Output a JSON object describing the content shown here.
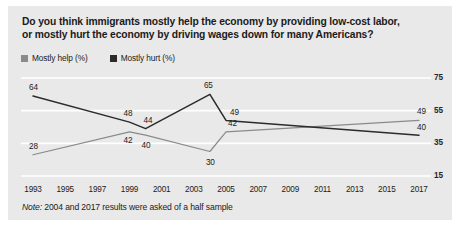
{
  "card": {
    "background": "#e9e9e9"
  },
  "title": {
    "line1": "Do you think immigrants mostly help the economy by providing low-cost labor,",
    "line2": "or mostly hurt the economy by driving wages down for many Americans?"
  },
  "note": {
    "prefix": "Note:",
    "text": " 2004 and 2017 results were asked of a half sample"
  },
  "chart_data": {
    "type": "line",
    "title": "Do you think immigrants mostly help the economy by providing low-cost labor, or mostly hurt the economy by driving wages down for many Americans?",
    "xlabel": "",
    "ylabel": "",
    "ylim": [
      15,
      75
    ],
    "yticks": [
      75,
      55,
      35,
      15
    ],
    "grid": true,
    "legend_position": "top-left",
    "xticks": [
      1993,
      1995,
      1997,
      1999,
      2001,
      2003,
      2005,
      2007,
      2009,
      2011,
      2013,
      2015,
      2017
    ],
    "series": [
      {
        "name": "Mostly help (%)",
        "color": "#8a8a8a",
        "points": [
          {
            "x": 1993,
            "y": 28,
            "label": "28"
          },
          {
            "x": 1999,
            "y": 42,
            "label": "42"
          },
          {
            "x": 2000,
            "y": 40,
            "label": "40"
          },
          {
            "x": 2004,
            "y": 30,
            "label": "30"
          },
          {
            "x": 2005,
            "y": 42,
            "label": "42"
          },
          {
            "x": 2017,
            "y": 49,
            "label": "49"
          }
        ]
      },
      {
        "name": "Mostly hurt (%)",
        "color": "#2b2b2b",
        "points": [
          {
            "x": 1993,
            "y": 64,
            "label": "64"
          },
          {
            "x": 1999,
            "y": 48,
            "label": "48"
          },
          {
            "x": 2000,
            "y": 44,
            "label": "44"
          },
          {
            "x": 2004,
            "y": 65,
            "label": "65"
          },
          {
            "x": 2005,
            "y": 49,
            "label": "49"
          },
          {
            "x": 2017,
            "y": 40,
            "label": "40"
          }
        ]
      }
    ],
    "annotations": [
      "Note: 2004 and 2017 results were asked of a half sample"
    ]
  },
  "legend": {
    "items": [
      {
        "label": "Mostly help (%)",
        "color": "#8a8a8a"
      },
      {
        "label": "Mostly hurt (%)",
        "color": "#2b2b2b"
      }
    ]
  },
  "axis": {
    "yticklabels": [
      "75",
      "55",
      "35",
      "15"
    ],
    "xticklabels": [
      "1993",
      "1995",
      "1997",
      "1999",
      "2001",
      "2003",
      "2005",
      "2007",
      "2009",
      "2011",
      "2013",
      "2015",
      "2017"
    ]
  },
  "datalabels": {
    "help": [
      "28",
      "42",
      "40",
      "30",
      "42",
      "49"
    ],
    "hurt": [
      "64",
      "48",
      "44",
      "65",
      "49",
      "40"
    ]
  }
}
